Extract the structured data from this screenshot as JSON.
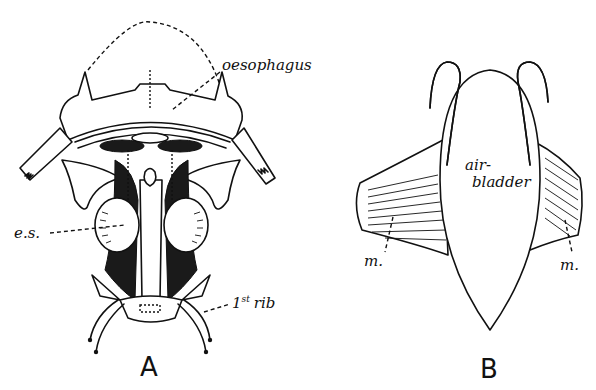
{
  "figure": {
    "panels": [
      {
        "id": "A",
        "label": "A",
        "annotations": [
          {
            "text": "oesophagus",
            "target": "oesophagus"
          },
          {
            "text": "e.s.",
            "target": "e.s."
          },
          {
            "text": "1st rib",
            "target": "first-rib"
          }
        ]
      },
      {
        "id": "B",
        "label": "B",
        "annotations": [
          {
            "text": "air-",
            "target": "air-bladder"
          },
          {
            "text": "bladder",
            "target": "air-bladder"
          },
          {
            "text": "m.",
            "target": "muscle-left"
          },
          {
            "text": "m.",
            "target": "muscle-right"
          }
        ]
      }
    ],
    "rib_label": {
      "ordinal": "1",
      "suffix": "st",
      "word": "rib"
    }
  }
}
